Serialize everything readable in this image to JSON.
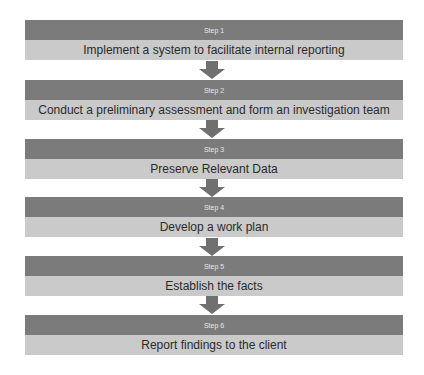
{
  "steps": [
    {
      "label": "Step 1",
      "text": "Implement a system to facilitate internal reporting"
    },
    {
      "label": "Step 2",
      "text": "Conduct a preliminary assessment and form an investigation team"
    },
    {
      "label": "Step 3",
      "text": "Preserve Relevant Data"
    },
    {
      "label": "Step 4",
      "text": "Develop a work plan"
    },
    {
      "label": "Step 5",
      "text": "Establish the facts"
    },
    {
      "label": "Step 6",
      "text": "Report findings to the client"
    }
  ],
  "colors": {
    "header": "#7b7b7b",
    "body": "#cacaca",
    "arrow": "#707070"
  }
}
